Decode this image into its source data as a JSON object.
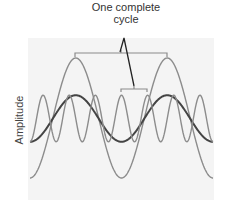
{
  "annotation": {
    "line1": "One complete",
    "line2": "cycle"
  },
  "axis": {
    "ylabel": "Amplitude"
  },
  "waves": [
    {
      "name": "large-amplitude-wave",
      "relative_amplitude": 1.0,
      "cycles_shown": 2,
      "phase": "trough-start",
      "color": "#8c8c8c"
    },
    {
      "name": "medium-amplitude-wave",
      "relative_amplitude": 0.4,
      "cycles_shown": 2,
      "phase": "trough-start",
      "color": "#444444"
    },
    {
      "name": "high-frequency-wave",
      "relative_amplitude": 0.4,
      "cycles_shown": 7,
      "phase": "trough-start",
      "color": "#8c8c8c"
    }
  ],
  "colors": {
    "background_panel": "#f3f3f3",
    "bracket": "#8a8a8a",
    "pointer": "#222222"
  }
}
